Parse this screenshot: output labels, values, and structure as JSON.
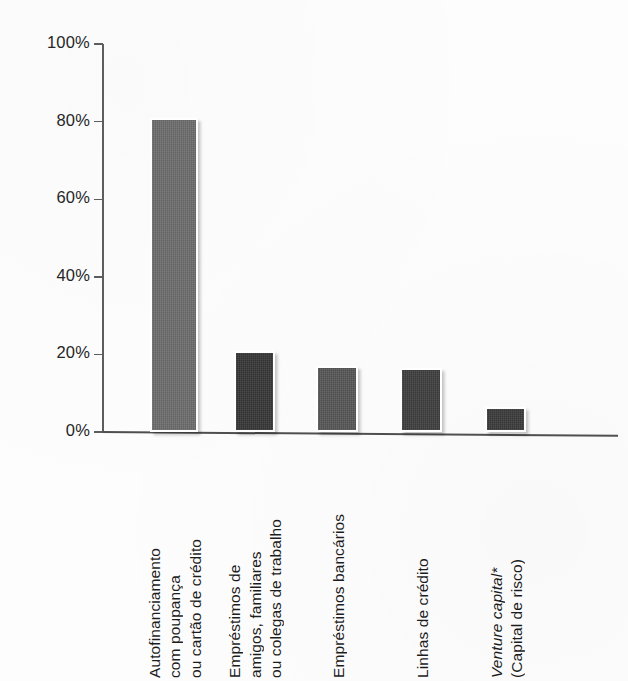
{
  "chart_data": {
    "type": "bar",
    "title": "",
    "subtitle": "",
    "xlabel": "",
    "ylabel": "",
    "ylim": [
      0,
      100
    ],
    "ytick_labels": [
      "100%",
      "80%",
      "60%",
      "40%",
      "20%",
      "0%"
    ],
    "ytick_values": [
      100,
      80,
      60,
      40,
      20,
      0
    ],
    "grid": false,
    "legend": null,
    "value_suffix": "%",
    "categories": [
      "Autofinanciamento com poupança ou cartão de crédito",
      "Empréstimos de amigos, familiares ou colegas de trabalho",
      "Empréstimos bancários",
      "Linhas de crédito",
      "Venture capital* (Capital de risco)"
    ],
    "values": [
      81,
      21,
      17,
      16.5,
      6.5
    ],
    "bar_colors": [
      "#6d6d6d",
      "#373737",
      "#575757",
      "#3f3f3f",
      "#3b3b3b"
    ]
  },
  "axis": {
    "ticks": [
      {
        "label": "100%",
        "value": 100
      },
      {
        "label": "80%",
        "value": 80
      },
      {
        "label": "60%",
        "value": 60
      },
      {
        "label": "40%",
        "value": 40
      },
      {
        "label": "20%",
        "value": 20
      },
      {
        "label": "0%",
        "value": 0
      }
    ]
  },
  "bars": [
    {
      "name": "autofinanciamento",
      "value": 81,
      "color": "#6d6d6d",
      "label_lines": [
        {
          "text": "Autofinanciamento",
          "italic": false
        },
        {
          "text": "com poupança",
          "italic": false
        },
        {
          "text": "ou cartão de crédito",
          "italic": false
        }
      ]
    },
    {
      "name": "emprestimos-amigos",
      "value": 21,
      "color": "#373737",
      "label_lines": [
        {
          "text": "Empréstimos de",
          "italic": false
        },
        {
          "text": "amigos, familiares",
          "italic": false
        },
        {
          "text": "ou colegas de trabalho",
          "italic": false
        }
      ]
    },
    {
      "name": "emprestimos-bancarios",
      "value": 17,
      "color": "#575757",
      "label_lines": [
        {
          "text": "Empréstimos bancários",
          "italic": false
        }
      ]
    },
    {
      "name": "linhas-de-credito",
      "value": 16.5,
      "color": "#3f3f3f",
      "label_lines": [
        {
          "text": "Linhas de crédito",
          "italic": false
        }
      ]
    },
    {
      "name": "venture-capital",
      "value": 6.5,
      "color": "#3b3b3b",
      "label_lines": [
        {
          "text": "Venture capital*",
          "italic": true
        },
        {
          "text": "(Capital de risco)",
          "italic": false
        }
      ]
    }
  ]
}
